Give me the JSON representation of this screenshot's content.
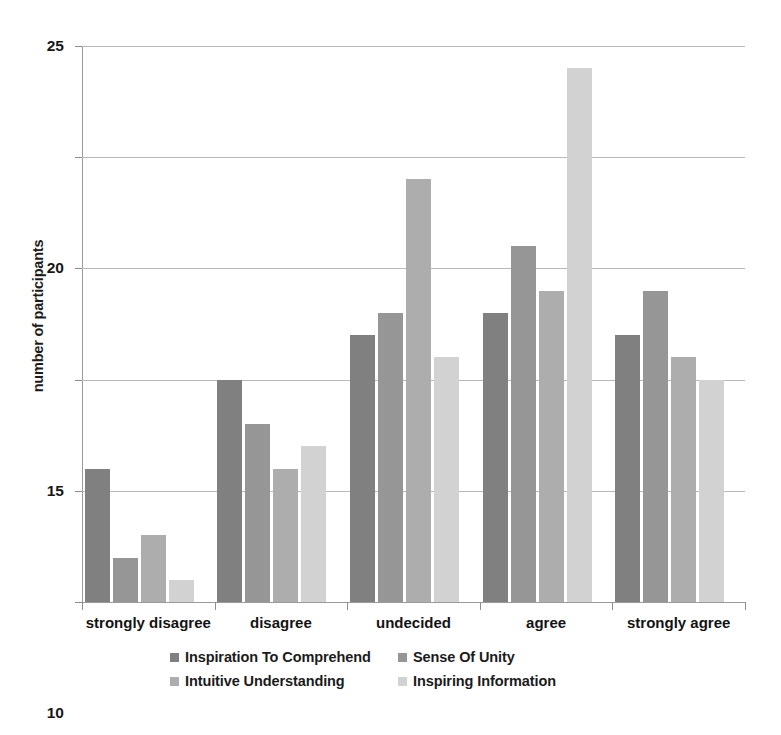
{
  "chart_data": {
    "type": "bar",
    "title": "",
    "xlabel": "",
    "ylabel": "number of participants",
    "ylim": [
      0,
      25
    ],
    "yticks": [
      0,
      5,
      10,
      15,
      20,
      25
    ],
    "grid": true,
    "legend_position": "bottom",
    "categories": [
      "strongly disagree",
      "disagree",
      "undecided",
      "agree",
      "strongly agree"
    ],
    "series": [
      {
        "name": "Inspiration To Comprehend",
        "color": "#808080",
        "values": [
          6,
          10,
          12,
          13,
          12
        ]
      },
      {
        "name": "Sense Of Unity",
        "color": "#969696",
        "values": [
          2,
          8,
          13,
          16,
          14
        ]
      },
      {
        "name": "Intuitive Understanding",
        "color": "#adadad",
        "values": [
          3,
          6,
          19,
          14,
          11
        ]
      },
      {
        "name": "Inspiring Information",
        "color": "#d2d2d2",
        "values": [
          1,
          7,
          11,
          24,
          10
        ]
      }
    ]
  }
}
